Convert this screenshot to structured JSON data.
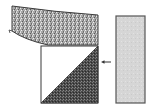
{
  "diagram": {
    "type": "schematic",
    "elements": [
      {
        "id": "curved-band",
        "description": "Curved speckled (stippled) band bending along the top",
        "fill": "#9a9a9a"
      },
      {
        "id": "square-block",
        "description": "Square block split diagonally into white upper-left and dark hatched lower-right triangles",
        "fill_light": "#ffffff",
        "fill_dark": "#555555"
      },
      {
        "id": "arrow",
        "description": "Small arrow pointing left toward the square block",
        "direction": "left"
      },
      {
        "id": "side-panel",
        "description": "Tall light-gray rectangle on the right",
        "fill": "#d6d6d6"
      }
    ],
    "colors": {
      "outline": "#3a3a3a",
      "speckle": "#8c8c8c",
      "dark_triangle": "#4a4a4a",
      "panel": "#d8d8d8"
    }
  }
}
